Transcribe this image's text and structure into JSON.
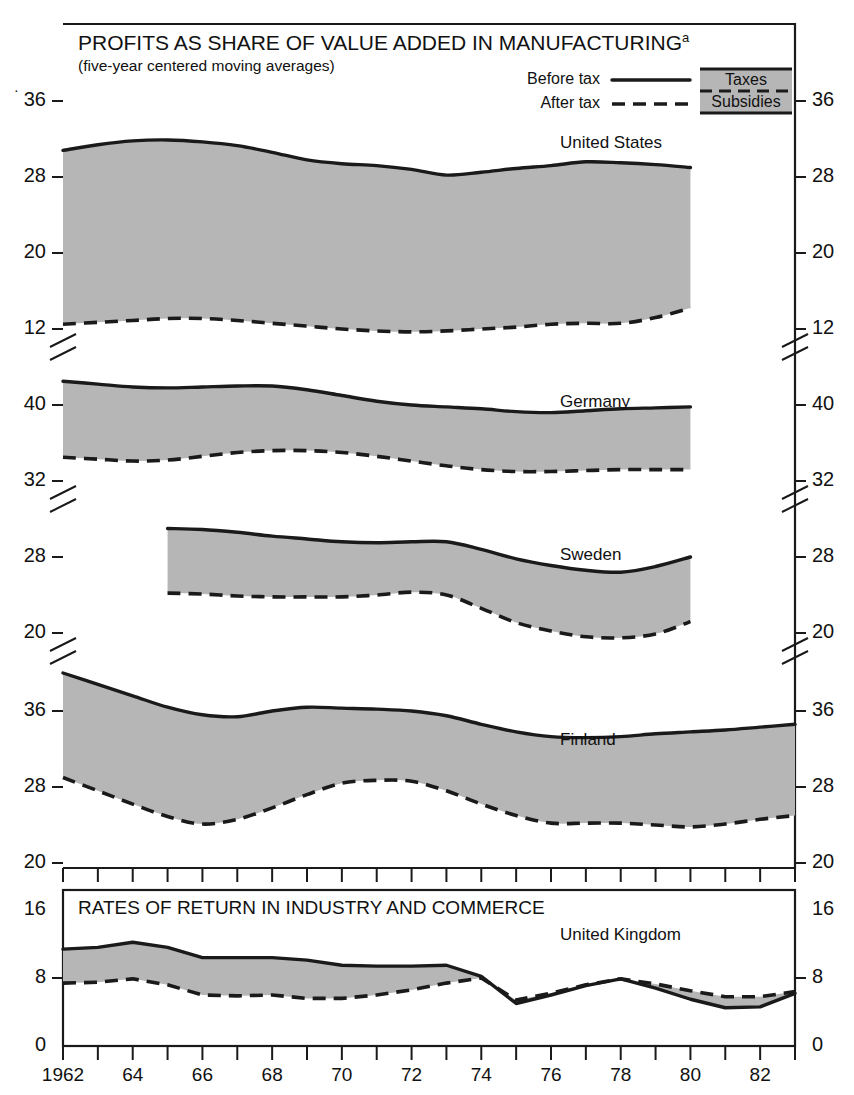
{
  "figure": {
    "title": "PROFITS AS SHARE OF VALUE ADDED IN MANUFACTURING",
    "title_superscript": "a",
    "subtitle": "(five-year centered moving averages)",
    "bottom_panel_title": "RATES OF RETURN IN INDUSTRY AND COMMERCE",
    "fill_color": "#b6b6b6",
    "line_color": "#1a1a1a",
    "background": "#ffffff"
  },
  "legend": {
    "before_tax_label": "Before tax",
    "after_tax_label": "After tax",
    "taxes_label": "Taxes",
    "subsidies_label": "Subsidies",
    "before_tax_style": "solid",
    "after_tax_style": "dashed"
  },
  "xaxis": {
    "start_year": 1962,
    "end_year": 1983,
    "first_label": "1962",
    "tick_labels": [
      "1962",
      "64",
      "66",
      "68",
      "70",
      "72",
      "74",
      "76",
      "78",
      "80",
      "82"
    ],
    "tick_years": [
      1962,
      1964,
      1966,
      1968,
      1970,
      1972,
      1974,
      1976,
      1978,
      1980,
      1982
    ],
    "minor_tick_interval": 1
  },
  "chart_data": {
    "type": "area",
    "title": "PROFITS AS SHARE OF VALUE ADDED IN MANUFACTURING",
    "subtitle": "(five-year centered moving averages)",
    "xlabel": "",
    "ylabel": "",
    "grid": false,
    "legend_position": "top-right",
    "x": [
      1962,
      1963,
      1964,
      1965,
      1966,
      1967,
      1968,
      1969,
      1970,
      1971,
      1972,
      1973,
      1974,
      1975,
      1976,
      1977,
      1978,
      1979,
      1980,
      1981,
      1982,
      1983
    ],
    "panels": [
      {
        "name": "United States",
        "label": "United States",
        "ylim": [
          12,
          40
        ],
        "ticks": [
          12,
          20,
          28,
          36
        ],
        "tick_labels": [
          "12",
          "20",
          "28",
          "36"
        ],
        "axis_break_below": 12,
        "x_start": 1962,
        "x_end": 1980,
        "series": [
          {
            "name": "Before tax",
            "style": "solid",
            "x": [
              1962,
              1963,
              1964,
              1965,
              1966,
              1967,
              1968,
              1969,
              1970,
              1971,
              1972,
              1973,
              1974,
              1975,
              1976,
              1977,
              1978,
              1979,
              1980
            ],
            "values": [
              30.8,
              31.4,
              31.8,
              31.9,
              31.7,
              31.3,
              30.6,
              29.8,
              29.4,
              29.2,
              28.8,
              28.2,
              28.5,
              28.9,
              29.2,
              29.6,
              29.5,
              29.3,
              29.0
            ]
          },
          {
            "name": "After tax",
            "style": "dashed",
            "x": [
              1962,
              1963,
              1964,
              1965,
              1966,
              1967,
              1968,
              1969,
              1970,
              1971,
              1972,
              1973,
              1974,
              1975,
              1976,
              1977,
              1978,
              1979,
              1980
            ],
            "values": [
              12.5,
              12.7,
              12.9,
              13.1,
              13.1,
              12.9,
              12.6,
              12.3,
              12.0,
              11.8,
              11.7,
              11.8,
              12.0,
              12.2,
              12.5,
              12.6,
              12.6,
              13.2,
              14.2
            ]
          }
        ]
      },
      {
        "name": "Germany",
        "label": "Germany",
        "ylim": [
          32,
          44
        ],
        "ticks": [
          32,
          40
        ],
        "tick_labels": [
          "32",
          "40"
        ],
        "axis_break_below": 32,
        "x_start": 1962,
        "x_end": 1980,
        "series": [
          {
            "name": "Before tax",
            "style": "solid",
            "x": [
              1962,
              1963,
              1964,
              1965,
              1966,
              1967,
              1968,
              1969,
              1970,
              1971,
              1972,
              1973,
              1974,
              1975,
              1976,
              1977,
              1978,
              1979,
              1980
            ],
            "values": [
              42.5,
              42.2,
              41.9,
              41.8,
              41.9,
              42.0,
              42.0,
              41.6,
              41.0,
              40.4,
              40.0,
              39.8,
              39.6,
              39.3,
              39.2,
              39.4,
              39.6,
              39.7,
              39.8
            ]
          },
          {
            "name": "After tax",
            "style": "dashed",
            "x": [
              1962,
              1963,
              1964,
              1965,
              1966,
              1967,
              1968,
              1969,
              1970,
              1971,
              1972,
              1973,
              1974,
              1975,
              1976,
              1977,
              1978,
              1979,
              1980
            ],
            "values": [
              34.5,
              34.3,
              34.1,
              34.2,
              34.6,
              35.0,
              35.2,
              35.2,
              35.0,
              34.6,
              34.1,
              33.6,
              33.2,
              33.0,
              33.0,
              33.1,
              33.2,
              33.2,
              33.2
            ]
          }
        ]
      },
      {
        "name": "Sweden",
        "label": "Sweden",
        "ylim": [
          20,
          32
        ],
        "ticks": [
          20,
          28
        ],
        "tick_labels": [
          "20",
          "28"
        ],
        "axis_break_below": 20,
        "x_start": 1965,
        "x_end": 1980,
        "series": [
          {
            "name": "Before tax",
            "style": "solid",
            "x": [
              1965,
              1966,
              1967,
              1968,
              1969,
              1970,
              1971,
              1972,
              1973,
              1974,
              1975,
              1976,
              1977,
              1978,
              1979,
              1980
            ],
            "values": [
              31.0,
              30.9,
              30.6,
              30.2,
              29.9,
              29.6,
              29.5,
              29.6,
              29.6,
              28.8,
              27.8,
              27.1,
              26.6,
              26.4,
              27.0,
              28.0
            ]
          },
          {
            "name": "After tax",
            "style": "dashed",
            "x": [
              1965,
              1966,
              1967,
              1968,
              1969,
              1970,
              1971,
              1972,
              1973,
              1974,
              1975,
              1976,
              1977,
              1978,
              1979,
              1980
            ],
            "values": [
              24.2,
              24.1,
              23.9,
              23.8,
              23.8,
              23.8,
              24.0,
              24.3,
              24.0,
              22.6,
              21.1,
              20.2,
              19.6,
              19.5,
              19.9,
              21.2
            ]
          }
        ]
      },
      {
        "name": "Finland",
        "label": "Finland",
        "ylim": [
          20,
          44
        ],
        "ticks": [
          20,
          28,
          36
        ],
        "tick_labels": [
          "20",
          "28",
          "36"
        ],
        "axis_break_below": 20,
        "x_start": 1962,
        "x_end": 1983,
        "series": [
          {
            "name": "Before tax",
            "style": "solid",
            "x": [
              1962,
              1963,
              1964,
              1965,
              1966,
              1967,
              1968,
              1969,
              1970,
              1971,
              1972,
              1973,
              1974,
              1975,
              1976,
              1977,
              1978,
              1979,
              1980,
              1981,
              1982,
              1983
            ],
            "values": [
              40.0,
              38.8,
              37.6,
              36.4,
              35.6,
              35.4,
              36.0,
              36.4,
              36.3,
              36.2,
              36.0,
              35.5,
              34.6,
              33.8,
              33.3,
              33.2,
              33.3,
              33.6,
              33.8,
              34.0,
              34.3,
              34.6
            ]
          },
          {
            "name": "After tax",
            "style": "dashed",
            "x": [
              1962,
              1963,
              1964,
              1965,
              1966,
              1967,
              1968,
              1969,
              1970,
              1971,
              1972,
              1973,
              1974,
              1975,
              1976,
              1977,
              1978,
              1979,
              1980,
              1981,
              1982,
              1983
            ],
            "values": [
              29.0,
              27.6,
              26.2,
              24.9,
              24.1,
              24.6,
              25.8,
              27.2,
              28.4,
              28.7,
              28.6,
              27.6,
              26.2,
              25.0,
              24.2,
              24.2,
              24.2,
              24.0,
              23.8,
              24.1,
              24.6,
              25.0
            ]
          }
        ]
      },
      {
        "name": "United Kingdom",
        "label": "United Kingdom",
        "panel_title": "RATES OF RETURN IN INDUSTRY AND COMMERCE",
        "ylim": [
          0,
          16
        ],
        "ticks": [
          0,
          8,
          16
        ],
        "tick_labels": [
          "0",
          "8",
          "16"
        ],
        "axis_break_below": null,
        "x_start": 1962,
        "x_end": 1983,
        "series": [
          {
            "name": "Before tax",
            "style": "solid",
            "x": [
              1962,
              1963,
              1964,
              1965,
              1966,
              1967,
              1968,
              1969,
              1970,
              1971,
              1972,
              1973,
              1974,
              1975,
              1976,
              1977,
              1978,
              1979,
              1980,
              1981,
              1982,
              1983
            ],
            "values": [
              11.4,
              11.6,
              12.2,
              11.6,
              10.4,
              10.4,
              10.4,
              10.1,
              9.5,
              9.4,
              9.4,
              9.5,
              8.2,
              5.0,
              6.0,
              7.1,
              7.9,
              6.8,
              5.5,
              4.5,
              4.6,
              6.2
            ]
          },
          {
            "name": "After tax",
            "style": "dashed",
            "x": [
              1962,
              1963,
              1964,
              1965,
              1966,
              1967,
              1968,
              1969,
              1970,
              1971,
              1972,
              1973,
              1974,
              1975,
              1976,
              1977,
              1978,
              1979,
              1980,
              1981,
              1982,
              1983
            ],
            "values": [
              7.4,
              7.5,
              7.9,
              7.2,
              6.0,
              5.9,
              6.0,
              5.6,
              5.6,
              6.0,
              6.6,
              7.4,
              8.0,
              5.4,
              6.2,
              7.2,
              7.9,
              7.3,
              6.5,
              5.8,
              5.8,
              6.4
            ]
          }
        ]
      }
    ]
  }
}
